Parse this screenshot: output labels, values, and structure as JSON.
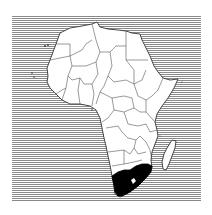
{
  "map": {
    "subject": "Africa",
    "highlighted_country": "South Africa",
    "colors": {
      "sea_hatch": "#8a8a8a",
      "land": "#ffffff",
      "borders": "#333333",
      "highlight": "#000000"
    },
    "style": "horizontal-hatched sea, white land, black highlighted country"
  }
}
